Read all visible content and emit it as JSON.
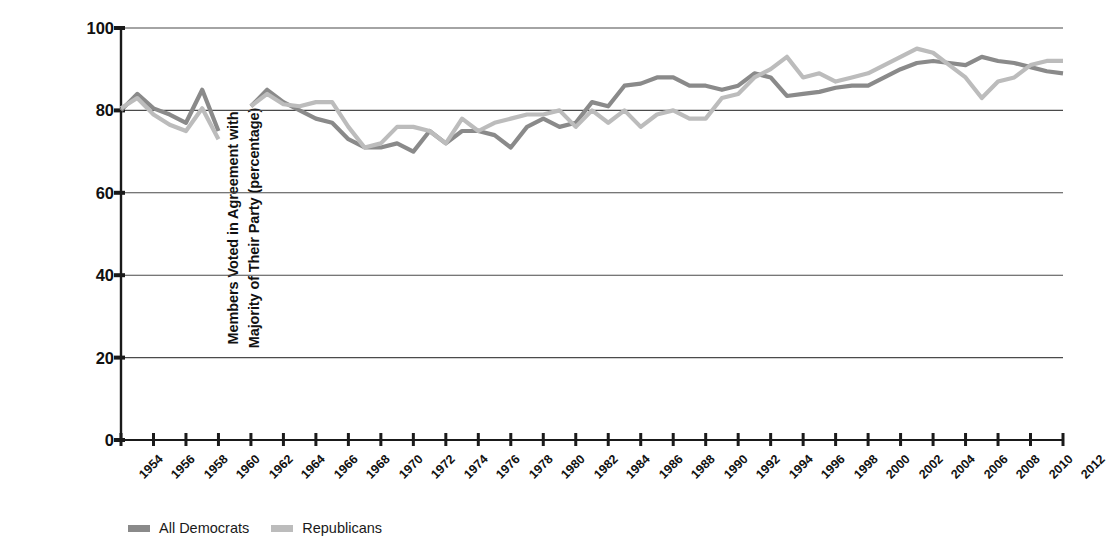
{
  "title_ghost": "",
  "chart_data": {
    "type": "line",
    "title": "",
    "xlabel": "",
    "ylabel": "Members Voted in Agreement with Majority of Their Party (percentage)",
    "ylabel_line1": "Members Voted in Agreement with",
    "ylabel_line2": "Majority of Their Party (percentage)",
    "ylim": [
      0,
      100
    ],
    "yticks": [
      0,
      20,
      40,
      60,
      80,
      100
    ],
    "xlim": [
      1954,
      2012
    ],
    "grid": true,
    "grid_axis": "y",
    "legend_position": "bottom-left",
    "categories": [
      1954,
      1955,
      1956,
      1957,
      1958,
      1959,
      1960,
      1961,
      1962,
      1963,
      1964,
      1965,
      1966,
      1967,
      1968,
      1969,
      1970,
      1971,
      1972,
      1973,
      1974,
      1975,
      1976,
      1977,
      1978,
      1979,
      1980,
      1981,
      1982,
      1983,
      1984,
      1985,
      1986,
      1987,
      1988,
      1989,
      1990,
      1991,
      1992,
      1993,
      1994,
      1995,
      1996,
      1997,
      1998,
      1999,
      2000,
      2001,
      2002,
      2003,
      2004,
      2005,
      2006,
      2007,
      2008,
      2009,
      2010,
      2011,
      2012
    ],
    "series": [
      {
        "name": "All Democrats",
        "color": "#8a8a8a",
        "values": [
          80,
          84,
          80.5,
          79,
          77,
          85,
          75,
          null,
          81,
          85,
          82,
          80,
          78,
          77,
          73,
          71,
          71,
          72,
          70,
          75,
          72,
          75,
          75,
          74,
          71,
          76,
          78,
          76,
          77,
          82,
          81,
          86,
          86.5,
          88,
          88,
          86,
          86,
          85,
          86,
          89,
          88,
          83.5,
          84,
          84.5,
          85.5,
          86,
          86,
          88,
          90,
          91.5,
          92,
          91.5,
          91,
          93,
          92,
          91.5,
          90.5,
          89.5,
          89
        ]
      },
      {
        "name": "Republicans",
        "color": "#bcbcbc",
        "values": [
          80.5,
          83,
          79,
          76.5,
          75,
          80.5,
          73,
          null,
          81,
          84,
          81.5,
          81,
          82,
          82,
          76,
          71,
          72,
          76,
          76,
          75,
          72,
          78,
          75,
          77,
          78,
          79,
          79,
          80,
          76,
          80,
          77,
          80,
          76,
          79,
          80,
          78,
          78,
          83,
          84,
          88,
          90,
          93,
          88,
          89,
          87,
          88,
          89,
          91,
          93,
          95,
          94,
          91,
          88,
          83,
          87,
          88,
          91,
          92,
          92
        ]
      }
    ]
  },
  "legend": {
    "items": [
      {
        "label": "All Democrats",
        "color": "#8a8a8a"
      },
      {
        "label": "Republicans",
        "color": "#bcbcbc"
      }
    ]
  },
  "axis": {
    "y_tick_labels": [
      "100",
      "80",
      "60",
      "40",
      "20",
      "0"
    ],
    "x_tick_labels": [
      "1954",
      "1956",
      "1958",
      "1960",
      "1962",
      "1964",
      "1966",
      "1968",
      "1970",
      "1972",
      "1974",
      "1976",
      "1978",
      "1980",
      "1982",
      "1984",
      "1986",
      "1988",
      "1990",
      "1992",
      "1994",
      "1996",
      "1998",
      "2000",
      "2002",
      "2004",
      "2006",
      "2008",
      "2010",
      "2012"
    ]
  }
}
